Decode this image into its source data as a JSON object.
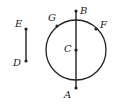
{
  "diagram": {
    "type": "geometry",
    "stroke_color": "#222222",
    "background": "#ffffff",
    "circle": {
      "center": "C",
      "cx": 76,
      "cy": 50,
      "r": 30
    },
    "segments": [
      {
        "name": "ED",
        "from": "E",
        "to": "D"
      },
      {
        "name": "BA",
        "from": "B",
        "to": "A"
      }
    ],
    "points": {
      "E": {
        "label": "E",
        "x": 26,
        "y": 29,
        "lx": 15,
        "ly": 27
      },
      "D": {
        "label": "D",
        "x": 26,
        "y": 61,
        "lx": 13,
        "ly": 66
      },
      "B": {
        "label": "B",
        "x": 76,
        "y": 11,
        "lx": 80,
        "ly": 14
      },
      "G": {
        "label": "G",
        "x": 57,
        "y": 26,
        "lx": 48,
        "ly": 21
      },
      "F": {
        "label": "F",
        "x": 96,
        "y": 29,
        "lx": 100,
        "ly": 28
      },
      "C": {
        "label": "C",
        "x": 76,
        "y": 50,
        "lx": 64,
        "ly": 52
      },
      "A": {
        "label": "A",
        "x": 76,
        "y": 88,
        "lx": 64,
        "ly": 98
      }
    }
  }
}
